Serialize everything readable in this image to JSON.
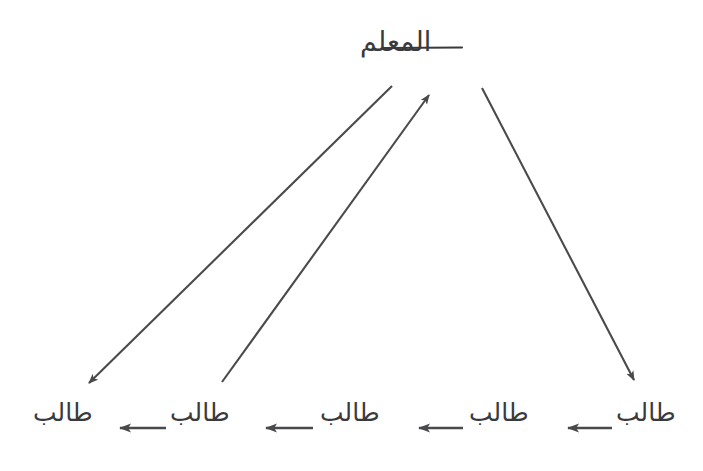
{
  "diagram": {
    "title_text": "المعلم",
    "type": "directed-graph",
    "stroke_color": "#4a4a4c",
    "text_color": "#3a3a3c",
    "background_color": "#ffffff",
    "top_node": {
      "label": "المعلم",
      "name": "teacher",
      "x": 440,
      "y": 48
    },
    "bottom_nodes": [
      {
        "label": "طالب",
        "name": "student-1",
        "x": 638,
        "y": 418
      },
      {
        "label": "طالب",
        "name": "student-2",
        "x": 492,
        "y": 418
      },
      {
        "label": "طالب",
        "name": "student-3",
        "x": 342,
        "y": 418
      },
      {
        "label": "طالب",
        "name": "student-4",
        "x": 192,
        "y": 418
      },
      {
        "label": "طالب",
        "name": "student-5",
        "x": 55,
        "y": 418
      }
    ],
    "diagonal_arrows": [
      {
        "name": "teacher-to-leftmost-student",
        "direction": "down-left",
        "from_x": 392,
        "from_y": 86,
        "to_x": 84,
        "to_y": 388
      },
      {
        "name": "student-to-teacher",
        "direction": "up-right",
        "from_x": 222,
        "from_y": 382,
        "to_x": 433,
        "to_y": 92
      },
      {
        "name": "teacher-to-rightmost-student",
        "direction": "down-right",
        "from_x": 482,
        "from_y": 88,
        "to_x": 638,
        "to_y": 388
      }
    ],
    "chain_arrows": [
      {
        "name": "student-chain-arrow-1",
        "from_x": 610,
        "to_x": 560,
        "y": 428
      },
      {
        "name": "student-chain-arrow-2",
        "from_x": 461,
        "to_x": 410,
        "y": 428
      },
      {
        "name": "student-chain-arrow-3",
        "from_x": 311,
        "to_x": 256,
        "y": 428
      },
      {
        "name": "student-chain-arrow-4",
        "from_x": 164,
        "to_x": 110,
        "y": 428
      }
    ]
  }
}
